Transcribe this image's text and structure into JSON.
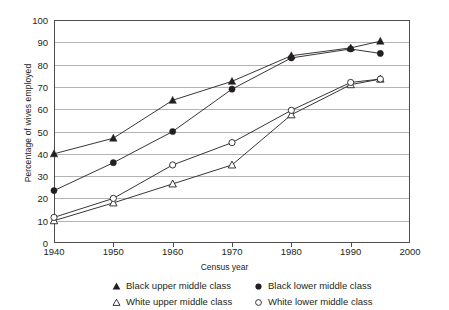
{
  "chart_data": {
    "type": "line",
    "title": "",
    "xlabel": "Census year",
    "ylabel": "Percentage of wives employed",
    "xlim": [
      1940,
      2000
    ],
    "ylim": [
      0,
      100
    ],
    "grid": true,
    "legend_position": "below",
    "xticks": [
      "1940",
      "1950",
      "1960",
      "1970",
      "1980",
      "1990",
      "2000"
    ],
    "yticks": [
      "0",
      "10",
      "20",
      "30",
      "40",
      "50",
      "60",
      "70",
      "80",
      "90",
      "100"
    ],
    "x": [
      1940,
      1950,
      1960,
      1970,
      1980,
      1990,
      1995
    ],
    "series": [
      {
        "name": "Black upper middle class",
        "marker": "filled-triangle",
        "values": [
          40,
          47,
          64,
          72.5,
          84,
          87.5,
          90.5
        ]
      },
      {
        "name": "Black lower middle class",
        "marker": "filled-circle",
        "values": [
          23.5,
          36,
          50,
          69,
          83,
          87,
          85
        ]
      },
      {
        "name": "White upper middle class",
        "marker": "open-triangle",
        "values": [
          10,
          18,
          26.5,
          35,
          57.5,
          71,
          73.5
        ]
      },
      {
        "name": "White lower middle class",
        "marker": "open-circle",
        "values": [
          11.5,
          20,
          35,
          45,
          59.5,
          72,
          73.5
        ]
      }
    ]
  },
  "legend": {
    "items": [
      {
        "marker": "filled-triangle",
        "label": "Black upper middle class"
      },
      {
        "marker": "open-triangle",
        "label": "White upper middle class"
      },
      {
        "marker": "filled-circle",
        "label": "Black lower middle class"
      },
      {
        "marker": "open-circle",
        "label": "White lower middle class"
      }
    ]
  },
  "colors": {
    "ink": "#231f20",
    "grid": "#b3b3b3",
    "frame": "#4d4d4d",
    "background": "#ffffff"
  }
}
